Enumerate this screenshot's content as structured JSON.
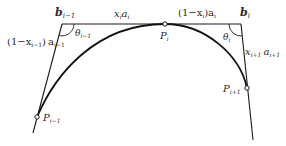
{
  "diagram": {
    "points": {
      "b_prev": {
        "label": "b",
        "sub": "i−1"
      },
      "b_cur": {
        "label": "b",
        "sub": "i"
      },
      "p_prev": {
        "label": "P",
        "sub": "i−1"
      },
      "p_cur": {
        "label": "P",
        "sub": "i"
      },
      "p_next": {
        "label": "P",
        "sub": "i+1"
      }
    },
    "segments": {
      "top_left": {
        "main": "x",
        "sub1": "i",
        "main2": "a",
        "sub2": "i"
      },
      "top_right": {
        "prefix": "(1−x",
        "sub1": "i",
        "mid": ")a",
        "sub2": "i"
      },
      "left": {
        "prefix": "(1−x",
        "sub1": "i−1",
        "mid": ") a",
        "sub2": "i−1"
      },
      "right": {
        "main": "x",
        "sub1": "i+1",
        "main2": " a",
        "sub2": "i+1"
      }
    },
    "angles": {
      "theta_prev": {
        "label": "θ",
        "sub": "i−1"
      },
      "theta_cur": {
        "label": "θ",
        "sub": "i"
      }
    },
    "colors": {
      "stroke": "#1a1a1a",
      "text": "#2a2a2a",
      "background": "#ffffff"
    }
  }
}
